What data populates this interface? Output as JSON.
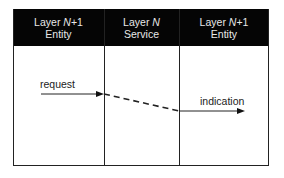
{
  "diagram": {
    "columns": [
      {
        "line1_prefix": "Layer ",
        "line1_italic": "N",
        "line1_suffix": "+1",
        "line2": "Entity"
      },
      {
        "line1_prefix": "Layer ",
        "line1_italic": "N",
        "line1_suffix": "",
        "line2": "Service"
      },
      {
        "line1_prefix": "Layer ",
        "line1_italic": "N",
        "line1_suffix": "+1",
        "line2": "Entity"
      }
    ],
    "labels": {
      "request": "request",
      "indication": "indication"
    },
    "colors": {
      "header_bg": "#050505",
      "header_text": "#e8e8e8",
      "line": "#222222"
    }
  }
}
